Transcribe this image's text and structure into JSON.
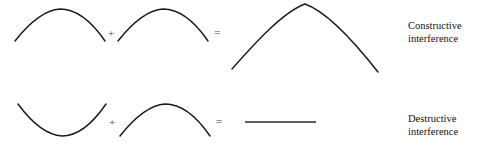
{
  "figure": {
    "background_color": "#ffffff",
    "stroke_color": "#1a1a1a",
    "width": 479,
    "height": 146
  },
  "rows": [
    {
      "id": "constructive",
      "caption_line1": "Constructive",
      "caption_line2": "interference",
      "operator_plus": "+",
      "operator_equals": "=",
      "operands": [
        {
          "name": "crest-wave-1",
          "shape": "crest",
          "path": "M 15 41 C 30 22, 45 10, 60 9 C 76 9, 92 22, 105 41"
        },
        {
          "name": "crest-wave-2",
          "shape": "crest",
          "path": "M 118 41 C 133 22, 148 10, 163 9 C 179 9, 195 22, 208 41"
        }
      ],
      "result": {
        "name": "constructive-result-wave",
        "shape": "large-crest",
        "path": "M 232 69 C 255 43, 283 12, 305 4 C 328 12, 356 44, 378 72"
      }
    },
    {
      "id": "destructive",
      "caption_line1": "Destructive",
      "caption_line2": "interference",
      "operator_plus": "+",
      "operator_equals": "=",
      "operands": [
        {
          "name": "trough-wave-1",
          "shape": "trough",
          "path": "M 18 104 C 32 123, 47 135, 62 136 C 78 136, 93 123, 106 104"
        },
        {
          "name": "crest-wave-3",
          "shape": "crest",
          "path": "M 120 136 C 135 117, 150 105, 165 104 C 181 104, 197 117, 210 136"
        }
      ],
      "result": {
        "name": "destructive-result-line",
        "shape": "flat-line",
        "path": "M 245 122 L 316 122"
      }
    }
  ],
  "symbol_positions": {
    "plus_top": {
      "x": 111,
      "y": 34
    },
    "equals_top": {
      "x": 217,
      "y": 33
    },
    "plus_bottom": {
      "x": 112,
      "y": 123
    },
    "equals_bottom": {
      "x": 219,
      "y": 122
    }
  }
}
